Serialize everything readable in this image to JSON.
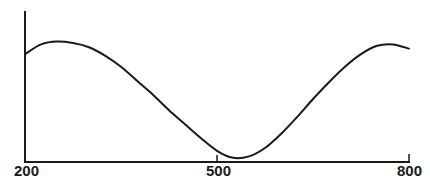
{
  "chart_data": {
    "type": "line",
    "title": "",
    "xlabel": "",
    "ylabel": "",
    "xlim": [
      200,
      800
    ],
    "x_ticks": [
      200,
      500,
      800
    ],
    "x_tick_labels": [
      "200",
      "500",
      "800"
    ],
    "y_ticks": [],
    "grid": false,
    "legend": null,
    "series": [
      {
        "name": "curve",
        "color": "#1a1a1a",
        "x": [
          200,
          225,
          250,
          275,
          300,
          325,
          350,
          375,
          400,
          425,
          450,
          475,
          500,
          525,
          550,
          575,
          600,
          625,
          650,
          675,
          700,
          725,
          750,
          775,
          800
        ],
        "y": [
          0.77,
          0.84,
          0.86,
          0.85,
          0.82,
          0.76,
          0.68,
          0.58,
          0.48,
          0.37,
          0.27,
          0.17,
          0.08,
          0.03,
          0.04,
          0.1,
          0.2,
          0.32,
          0.45,
          0.57,
          0.68,
          0.77,
          0.83,
          0.84,
          0.81
        ]
      }
    ],
    "annotations": []
  },
  "labels": {
    "x_start": "200",
    "x_mid": "500",
    "x_end": "800"
  }
}
